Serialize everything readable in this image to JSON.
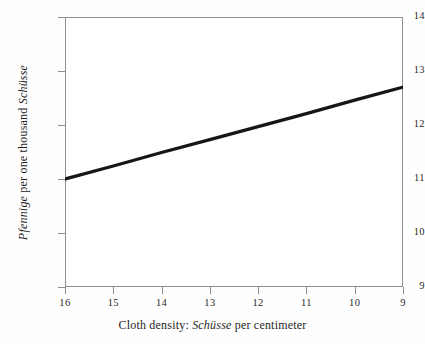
{
  "figure": {
    "background_color": "#fefefe",
    "frame_color": "#8e8e8e",
    "line_color": "#161616"
  },
  "axis_titles": {
    "x_prefix": "Cloth density: ",
    "x_italic": "Schüsse",
    "x_suffix": " per centimeter",
    "x_full": "Cloth density: Schüsse per centimeter",
    "y_italic_1": "Pfennige",
    "y_middle": " per one thousand ",
    "y_italic_2": "Schüsse",
    "y_full": "Pfennige per one thousand Schüsse"
  },
  "chart_data": {
    "type": "line",
    "title": "",
    "subtitle": "",
    "xlabel": "Cloth density: Schüsse per centimeter",
    "ylabel": "Pfennige per one thousand Schüsse",
    "xlim": [
      16,
      9
    ],
    "ylim": [
      9,
      14
    ],
    "x_axis_reversed": true,
    "grid": false,
    "legend": false,
    "legend_position": "none",
    "xticks": [
      16,
      15,
      14,
      13,
      12,
      11,
      10,
      9
    ],
    "xtick_labels": [
      "16",
      "15",
      "14",
      "13",
      "12",
      "11",
      "10",
      "9"
    ],
    "yticks": [
      9,
      10,
      11,
      12,
      13,
      14
    ],
    "ytick_labels": [
      "9",
      "10",
      "11",
      "12",
      "13",
      "14"
    ],
    "series": [
      {
        "name": "price per thousand Schüsse",
        "x": [
          16,
          15,
          14,
          13,
          12,
          11,
          10,
          9
        ],
        "values": [
          11.0,
          11.24,
          11.49,
          11.73,
          11.97,
          12.21,
          12.46,
          12.7
        ],
        "line_width": 3,
        "color": "#161616",
        "markers": false
      }
    ],
    "annotations": []
  }
}
